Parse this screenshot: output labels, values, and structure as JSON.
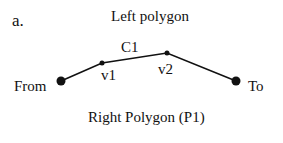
{
  "panel_label": "a.",
  "left_polygon_label": "Left polygon",
  "right_polygon_label": "Right Polygon (P1)",
  "edge_label": "C1",
  "nodes": {
    "from": {
      "label": "From",
      "x": 61,
      "y": 81
    },
    "v1": {
      "label": "v1",
      "x": 102,
      "y": 63
    },
    "v2": {
      "label": "v2",
      "x": 167,
      "y": 53
    },
    "to": {
      "label": "To",
      "x": 236,
      "y": 81
    }
  },
  "colors": {
    "line": "#111111",
    "background": "#ffffff"
  }
}
